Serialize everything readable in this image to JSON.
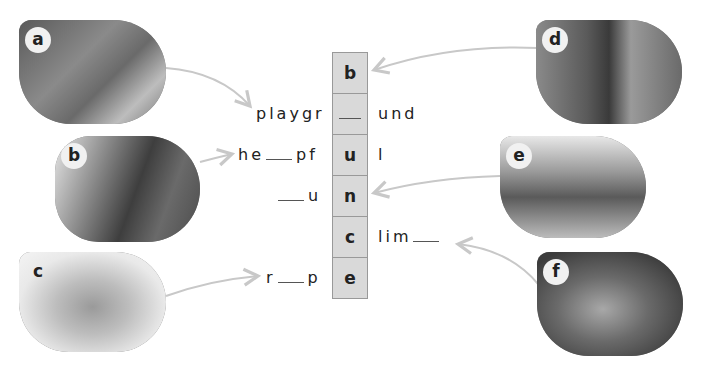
{
  "photos": [
    {
      "id": "a",
      "letter": "a",
      "subject": "playground"
    },
    {
      "id": "b",
      "letter": "b",
      "subject": "girls helping with string"
    },
    {
      "id": "c",
      "letter": "c",
      "subject": "coiled rope"
    },
    {
      "id": "d",
      "letter": "d",
      "subject": "girl holding ball"
    },
    {
      "id": "e",
      "letter": "e",
      "subject": "children running"
    },
    {
      "id": "f",
      "letter": "f",
      "subject": "boy climbing"
    }
  ],
  "column_letters": [
    "b",
    "",
    "u",
    "n",
    "c",
    "e"
  ],
  "words": {
    "playground": {
      "before": "playgr",
      "after": "und"
    },
    "helpful": {
      "before": "he",
      "mid": "pf",
      "after": "l"
    },
    "run": {
      "before": "",
      "after": "u"
    },
    "climb": {
      "before": "lim",
      "after": ""
    },
    "rope": {
      "before": "r",
      "after": "p"
    }
  },
  "colors": {
    "cell_bg": "#d9d9d9",
    "cell_border": "#999999",
    "arrow": "#c8c8c8"
  }
}
